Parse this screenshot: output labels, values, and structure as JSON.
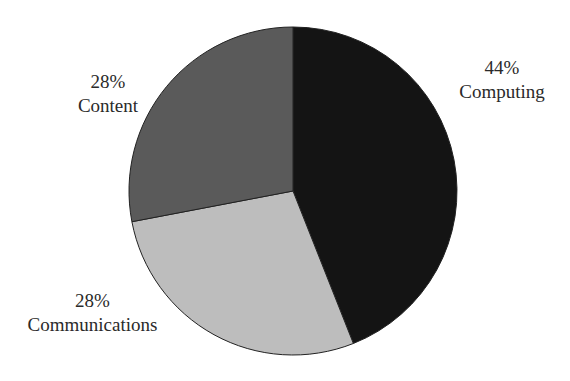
{
  "chart_data": {
    "type": "pie",
    "title": "",
    "slices": [
      {
        "label": "Computing",
        "value": 44,
        "display": "44%",
        "color": "#141414"
      },
      {
        "label": "Communications",
        "value": 28,
        "display": "28%",
        "color": "#bdbdbd"
      },
      {
        "label": "Content",
        "value": 28,
        "display": "28%",
        "color": "#5a5a5a"
      }
    ],
    "start_angle_deg": 0,
    "direction": "clockwise",
    "legend": "none",
    "labels_outside": true
  },
  "labels": {
    "computing": {
      "pct": "44%",
      "name": "Computing"
    },
    "communications": {
      "pct": "28%",
      "name": "Communications"
    },
    "content": {
      "pct": "28%",
      "name": "Content"
    }
  }
}
